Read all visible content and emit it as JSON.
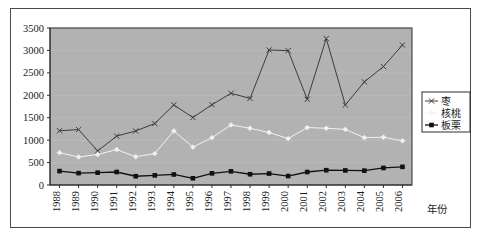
{
  "chart_data": {
    "type": "line",
    "title": "",
    "xlabel": "年份",
    "ylabel": "",
    "categories": [
      "1988",
      "1989",
      "1990",
      "1991",
      "1992",
      "1993",
      "1994",
      "1995",
      "1996",
      "1997",
      "1998",
      "1999",
      "2000",
      "2001",
      "2002",
      "2003",
      "2004",
      "2005",
      "2006"
    ],
    "ylim": [
      0,
      3500
    ],
    "yticks": [
      0,
      500,
      1000,
      1500,
      2000,
      2500,
      3000,
      3500
    ],
    "ytick_labels": [
      "0",
      "500",
      "1000",
      "1500",
      "2000",
      "2500",
      "3000",
      "3500"
    ],
    "grid": true,
    "legend_position": "right",
    "series": [
      {
        "name": "枣",
        "color": "#3c3c3c",
        "marker": "x",
        "values": [
          1210,
          1235,
          760,
          1090,
          1205,
          1370,
          1785,
          1505,
          1790,
          2045,
          1930,
          3010,
          2995,
          1910,
          3265,
          1785,
          2300,
          2640,
          3120
        ]
      },
      {
        "name": "核桃",
        "color": "#f2f2f2",
        "marker": "diamond",
        "values": [
          720,
          625,
          680,
          790,
          630,
          700,
          1205,
          845,
          1055,
          1340,
          1265,
          1170,
          1035,
          1280,
          1265,
          1240,
          1055,
          1065,
          985
        ]
      },
      {
        "name": "板栗",
        "color": "#111111",
        "marker": "square",
        "values": [
          310,
          265,
          275,
          290,
          195,
          215,
          235,
          150,
          260,
          305,
          240,
          255,
          200,
          290,
          330,
          325,
          320,
          380,
          405
        ]
      }
    ]
  },
  "plot": {
    "background_color": "#b2b2b2",
    "border_color": "#2e2e2e",
    "gridline_color": "#bdbdbd"
  },
  "legend": {
    "border_color": "#2e2e2e",
    "background_color": "#ffffff",
    "items": [
      {
        "label": "枣",
        "color": "#3c3c3c",
        "marker": "x"
      },
      {
        "label": "核桃",
        "color": "#f2f2f2",
        "marker": "diamond"
      },
      {
        "label": "板栗",
        "color": "#111111",
        "marker": "square"
      }
    ]
  },
  "figure": {
    "border_color": "#4a4a4a",
    "background_color": "#ffffff"
  }
}
